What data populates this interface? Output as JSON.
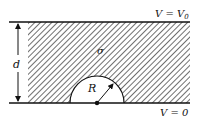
{
  "diagram": {
    "top_boundary_label": "V = V",
    "top_boundary_subscript": "0",
    "bottom_boundary_label": "V = 0",
    "conductivity_label": "σ",
    "radius_label": "R",
    "thickness_label": "d"
  },
  "colors": {
    "ink": "#111111",
    "background": "#ffffff"
  }
}
